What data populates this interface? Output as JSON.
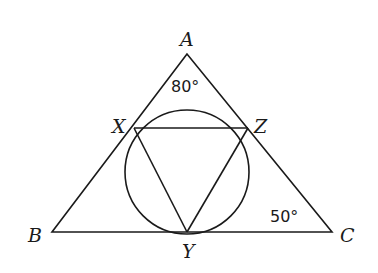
{
  "diagram": {
    "type": "geometry",
    "points": {
      "A": {
        "label": "A",
        "x": 187,
        "y": 54
      },
      "B": {
        "label": "B",
        "x": 52,
        "y": 232
      },
      "C": {
        "label": "C",
        "x": 332,
        "y": 232
      },
      "X": {
        "label": "X",
        "x": 134,
        "y": 128
      },
      "Y": {
        "label": "Y",
        "x": 187,
        "y": 232
      },
      "Z": {
        "label": "Z",
        "x": 248,
        "y": 128
      }
    },
    "circle": {
      "cx": 187,
      "cy": 172,
      "r": 62
    },
    "angles": {
      "A": {
        "label": "80°"
      },
      "C": {
        "label": "50°"
      }
    },
    "segments": [
      "AB",
      "BC",
      "CA",
      "XZ",
      "XY",
      "YZ"
    ]
  }
}
